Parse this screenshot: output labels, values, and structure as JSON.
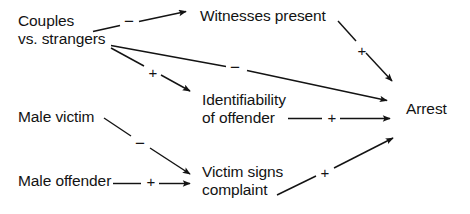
{
  "diagram": {
    "type": "path-diagram",
    "width": 470,
    "height": 214,
    "background_color": "#ffffff",
    "stroke_color": "#131313",
    "text_color": "#131313"
  },
  "nodes": [
    {
      "id": "couples-vs-strangers",
      "line1": "Couples",
      "line2": "vs. strangers",
      "x": 18,
      "y": 12
    },
    {
      "id": "witnesses-present",
      "line1": "Witnesses present",
      "line2": "",
      "x": 200,
      "y": 7
    },
    {
      "id": "identifiability-of-offender",
      "line1": "Identifiability",
      "line2": "of offender",
      "x": 202,
      "y": 91
    },
    {
      "id": "male-victim",
      "line1": "Male victim",
      "line2": "",
      "x": 18,
      "y": 108
    },
    {
      "id": "male-offender",
      "line1": "Male offender",
      "line2": "",
      "x": 18,
      "y": 172
    },
    {
      "id": "victim-signs-complaint",
      "line1": "Victim signs",
      "line2": "complaint",
      "x": 202,
      "y": 163
    },
    {
      "id": "arrest",
      "line1": "Arrest",
      "line2": "",
      "x": 406,
      "y": 100
    }
  ],
  "edges": [
    {
      "id": "couples-to-witnesses",
      "from": "couples-vs-strangers",
      "to": "witnesses-present",
      "sign": "−",
      "sign_x": 122,
      "sign_y": 14
    },
    {
      "id": "couples-to-arrest",
      "from": "couples-vs-strangers",
      "to": "arrest",
      "sign": "−",
      "sign_x": 228,
      "sign_y": 60
    },
    {
      "id": "couples-to-identifiability",
      "from": "couples-vs-strangers",
      "to": "identifiability-of-offender",
      "sign": "+",
      "sign_x": 146,
      "sign_y": 65
    },
    {
      "id": "witnesses-to-arrest",
      "from": "witnesses-present",
      "to": "arrest",
      "sign": "+",
      "sign_x": 355,
      "sign_y": 43
    },
    {
      "id": "identifiability-to-arrest",
      "from": "identifiability-of-offender",
      "to": "arrest",
      "sign": "+",
      "sign_x": 325,
      "sign_y": 110
    },
    {
      "id": "male-victim-to-victim-signs",
      "from": "male-victim",
      "to": "victim-signs-complaint",
      "sign": "−",
      "sign_x": 133,
      "sign_y": 136
    },
    {
      "id": "male-offender-to-victim-signs",
      "from": "male-offender",
      "to": "victim-signs-complaint",
      "sign": "+",
      "sign_x": 144,
      "sign_y": 174
    },
    {
      "id": "victim-signs-to-arrest",
      "from": "victim-signs-complaint",
      "to": "arrest",
      "sign": "+",
      "sign_x": 318,
      "sign_y": 165
    }
  ]
}
